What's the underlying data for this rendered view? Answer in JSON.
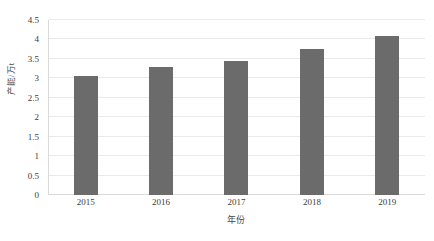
{
  "chart_data": {
    "type": "bar",
    "title": "",
    "subtitle": "",
    "categories": [
      "2015",
      "2016",
      "2017",
      "2018",
      "2019"
    ],
    "values": [
      3.05,
      3.3,
      3.45,
      3.75,
      4.1
    ],
    "series": [
      {
        "name": "",
        "values": [
          3.05,
          3.3,
          3.45,
          3.75,
          4.1
        ]
      }
    ],
    "xlabel": "年份",
    "ylabel": "产能/万t",
    "ylim": [
      0,
      4.5
    ],
    "ytick_labels": [
      "0",
      "0.5",
      "1",
      "1.5",
      "2",
      "2.5",
      "3",
      "3.5",
      "4",
      "4.5"
    ],
    "ytick_values": [
      0,
      0.5,
      1,
      1.5,
      2,
      2.5,
      3,
      3.5,
      4,
      4.5
    ],
    "xtick_labels": [
      "2015",
      "2016",
      "2017",
      "2018",
      "2019"
    ],
    "grid": true,
    "grid_axis": "y",
    "legend": false,
    "legend_position": "none",
    "annotations": [],
    "colors": {
      "bar": "#6b6b6b",
      "gridline": "#e9e9e9",
      "axis": "#d9d9d9",
      "background": "#ffffff",
      "text": "#3c3c3c"
    }
  }
}
